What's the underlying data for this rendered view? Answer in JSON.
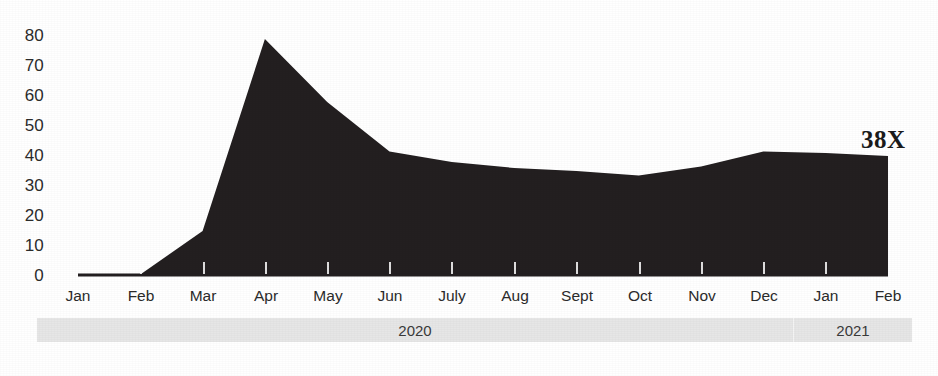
{
  "chart_data": {
    "type": "area",
    "title": "",
    "subtitle": "",
    "xlabel": "",
    "ylabel": "",
    "categories": [
      "Jan",
      "Feb",
      "Mar",
      "Apr",
      "May",
      "Jun",
      "July",
      "Aug",
      "Sept",
      "Oct",
      "Nov",
      "Dec",
      "Jan",
      "Feb"
    ],
    "values": [
      0.3,
      0.5,
      15,
      79,
      58,
      41.5,
      38,
      36,
      35,
      33.5,
      36.5,
      41.5,
      41,
      40
    ],
    "series": [
      {
        "name": "growth",
        "values": [
          0.3,
          0.5,
          15,
          79,
          58,
          41.5,
          38,
          36,
          35,
          33.5,
          36.5,
          41.5,
          41,
          40
        ]
      }
    ],
    "ylim": [
      0,
      80
    ],
    "yticks": [
      0,
      10,
      20,
      30,
      40,
      50,
      60,
      70,
      80
    ],
    "ytick_labels": [
      "0",
      "10",
      "20",
      "30",
      "40",
      "50",
      "60",
      "70",
      "80"
    ],
    "grid": false,
    "legend": "none",
    "fill_color": "#231f20",
    "background_color": "#ffffff",
    "annotations": [
      {
        "name": "end-value-multiple",
        "text": "38X",
        "x_category": "Feb",
        "position": "above-right-of-last-point"
      }
    ],
    "period_bands": [
      {
        "label": "2020",
        "start_category": "Jan",
        "end_category": "Dec"
      },
      {
        "label": "2021",
        "start_category": "Jan",
        "end_category": "Feb"
      }
    ],
    "band_color": "#e6e6e6"
  },
  "axis": {
    "y_labels": [
      "80",
      "70",
      "60",
      "50",
      "40",
      "30",
      "20",
      "10",
      "0"
    ],
    "x_labels": [
      "Jan",
      "Feb",
      "Mar",
      "Apr",
      "May",
      "Jun",
      "July",
      "Aug",
      "Sept",
      "Oct",
      "Nov",
      "Dec",
      "Jan",
      "Feb"
    ]
  },
  "annotation": {
    "multiple_label": "38X"
  },
  "bands": {
    "year_2020": "2020",
    "year_2021": "2021"
  }
}
